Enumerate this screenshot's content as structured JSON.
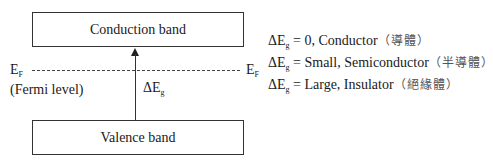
{
  "diagram": {
    "conduction_band": {
      "label": "Conduction band"
    },
    "valence_band": {
      "label": "Valence band"
    },
    "fermi_level": {
      "symbol": "E",
      "subscript": "F",
      "description": "(Fermi level)"
    },
    "band_gap": {
      "symbol": "ΔE",
      "subscript": "g"
    },
    "legend": [
      {
        "symbol": "ΔE",
        "subscript": "g",
        "condition": " = 0, Conductor",
        "chinese": "（導體）"
      },
      {
        "symbol": "ΔE",
        "subscript": "g",
        "condition": " = Small, Semiconductor",
        "chinese": "（半導體）"
      },
      {
        "symbol": "ΔE",
        "subscript": "g",
        "condition": " = Large, Insulator",
        "chinese": "（絕緣體）"
      }
    ],
    "colors": {
      "line": "#333333",
      "text": "#1a1a1a",
      "chinese_text": "#555555",
      "background": "#ffffff"
    }
  }
}
